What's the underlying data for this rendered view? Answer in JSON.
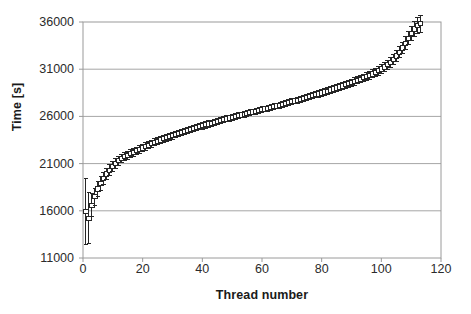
{
  "chart_data": {
    "type": "scatter",
    "title": "",
    "xlabel": "Thread number",
    "ylabel": "Time [s]",
    "xlim": [
      0,
      120
    ],
    "ylim": [
      11000,
      36000
    ],
    "xticks": [
      0,
      20,
      40,
      60,
      80,
      100,
      120
    ],
    "yticks": [
      11000,
      16000,
      21000,
      26000,
      31000,
      36000
    ],
    "grid": "horizontal",
    "legend": "none",
    "marker": "open-square",
    "errorbars": true,
    "series": [
      {
        "name": "Thread completion time",
        "x": [
          1,
          2,
          3,
          4,
          5,
          6,
          7,
          8,
          9,
          10,
          11,
          12,
          13,
          14,
          15,
          16,
          17,
          18,
          19,
          20,
          21,
          22,
          23,
          24,
          25,
          26,
          27,
          28,
          29,
          30,
          31,
          32,
          33,
          34,
          35,
          36,
          37,
          38,
          39,
          40,
          41,
          42,
          43,
          44,
          45,
          46,
          47,
          48,
          49,
          50,
          51,
          52,
          53,
          54,
          55,
          56,
          57,
          58,
          59,
          60,
          61,
          62,
          63,
          64,
          65,
          66,
          67,
          68,
          69,
          70,
          71,
          72,
          73,
          74,
          75,
          76,
          77,
          78,
          79,
          80,
          81,
          82,
          83,
          84,
          85,
          86,
          87,
          88,
          89,
          90,
          91,
          92,
          93,
          94,
          95,
          96,
          97,
          98,
          99,
          100,
          101,
          102,
          103,
          104,
          105,
          106,
          107,
          108,
          109,
          110,
          111,
          112,
          113
        ],
        "y": [
          15900,
          15200,
          16600,
          17500,
          18300,
          18900,
          19400,
          19900,
          20300,
          20700,
          21000,
          21300,
          21550,
          21750,
          21900,
          22050,
          22200,
          22350,
          22500,
          22650,
          22800,
          22950,
          23100,
          23250,
          23380,
          23500,
          23620,
          23740,
          23850,
          23960,
          24070,
          24180,
          24290,
          24400,
          24510,
          24610,
          24710,
          24810,
          24910,
          25000,
          25100,
          25190,
          25280,
          25370,
          25460,
          25550,
          25640,
          25730,
          25820,
          25900,
          25990,
          26070,
          26150,
          26230,
          26310,
          26390,
          26470,
          26550,
          26630,
          26710,
          26790,
          26870,
          26950,
          27030,
          27110,
          27190,
          27270,
          27360,
          27450,
          27540,
          27630,
          27720,
          27810,
          27900,
          27990,
          28080,
          28180,
          28280,
          28380,
          28480,
          28580,
          28680,
          28790,
          28900,
          29010,
          29120,
          29230,
          29340,
          29460,
          29580,
          29700,
          29820,
          29950,
          30080,
          30210,
          30350,
          30500,
          30660,
          30830,
          31020,
          31230,
          31470,
          31740,
          32050,
          32400,
          32800,
          33250,
          33750,
          34280,
          34800,
          35250,
          35600,
          35800
        ],
        "yerr": [
          3500,
          2700,
          1200,
          900,
          800,
          700,
          650,
          600,
          560,
          530,
          500,
          480,
          460,
          440,
          430,
          420,
          410,
          400,
          395,
          390,
          385,
          380,
          375,
          370,
          368,
          365,
          362,
          360,
          358,
          356,
          354,
          352,
          350,
          348,
          346,
          344,
          342,
          340,
          338,
          336,
          334,
          332,
          330,
          328,
          326,
          324,
          322,
          320,
          318,
          316,
          314,
          312,
          310,
          308,
          306,
          304,
          302,
          300,
          300,
          300,
          300,
          300,
          300,
          300,
          302,
          304,
          306,
          308,
          310,
          312,
          314,
          316,
          318,
          320,
          322,
          324,
          326,
          328,
          330,
          332,
          334,
          336,
          338,
          340,
          345,
          350,
          355,
          360,
          365,
          370,
          375,
          382,
          390,
          398,
          406,
          415,
          425,
          436,
          448,
          462,
          478,
          496,
          516,
          540,
          566,
          596,
          630,
          668,
          710,
          755,
          800,
          845,
          880
        ]
      }
    ]
  },
  "axes": {
    "y_tick_labels": [
      "36000",
      "31000",
      "26000",
      "21000",
      "16000",
      "11000"
    ],
    "x_tick_labels": [
      "0",
      "20",
      "40",
      "60",
      "80",
      "100",
      "120"
    ],
    "x_axis_title": "Thread number",
    "y_axis_title": "Time [s]"
  },
  "colors": {
    "plot_border": "#9a9a9a",
    "gridline": "#a6a6a6",
    "data": "#262626",
    "text": "#1a1a1a",
    "background": "#ffffff"
  }
}
